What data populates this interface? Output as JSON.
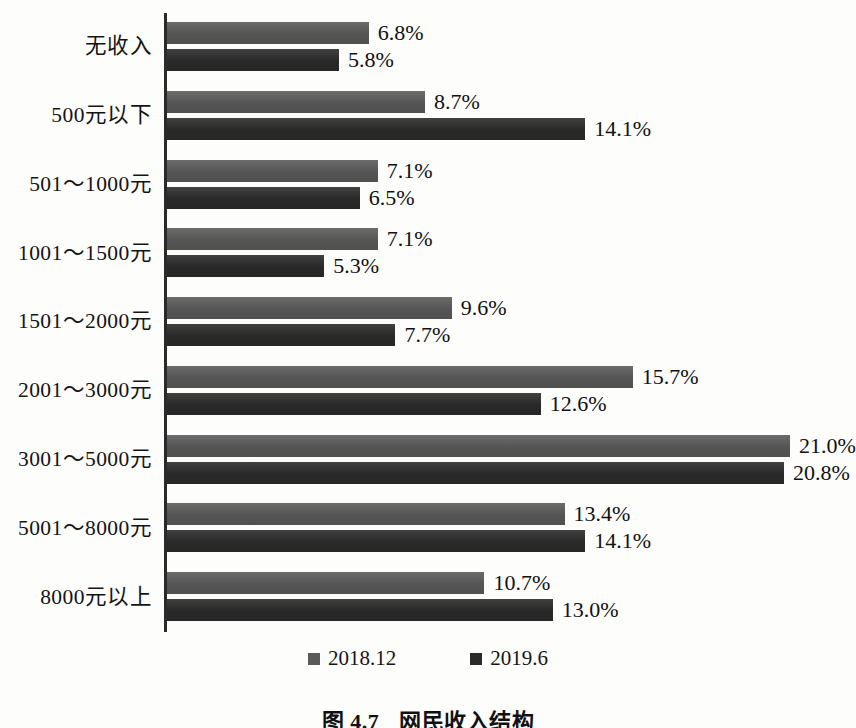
{
  "caption": {
    "number": "图 4.7",
    "title": "网民收入结构"
  },
  "legend": {
    "position": "bottom-center",
    "items": [
      {
        "label": "2018.12",
        "color": "#5a5a5a"
      },
      {
        "label": "2019.6",
        "color": "#2b2b2b"
      }
    ]
  },
  "chart_data": {
    "type": "bar",
    "orientation": "horizontal",
    "title": "网民收入结构",
    "xlabel": "",
    "ylabel": "",
    "grid": false,
    "legend_position": "bottom-center",
    "axis_max_percent": 23.2,
    "categories": [
      "无收入",
      "500元以下",
      "501～1000元",
      "1001～1500元",
      "1501～2000元",
      "2001～3000元",
      "3001～5000元",
      "5001～8000元",
      "8000元以上"
    ],
    "series": [
      {
        "name": "2018.12",
        "color": "#5a5a5a",
        "values": [
          6.8,
          8.7,
          7.1,
          7.1,
          9.6,
          15.7,
          21.0,
          13.4,
          10.7
        ],
        "labels": [
          "6.8%",
          "8.7%",
          "7.1%",
          "7.1%",
          "9.6%",
          "15.7%",
          "21.0%",
          "13.4%",
          "10.7%"
        ]
      },
      {
        "name": "2019.6",
        "color": "#2b2b2b",
        "values": [
          5.8,
          14.1,
          6.5,
          5.3,
          7.7,
          12.6,
          20.8,
          14.1,
          13.0
        ],
        "labels": [
          "5.8%",
          "14.1%",
          "6.5%",
          "5.3%",
          "7.7%",
          "12.6%",
          "20.8%",
          "14.1%",
          "13.0%"
        ]
      }
    ]
  }
}
